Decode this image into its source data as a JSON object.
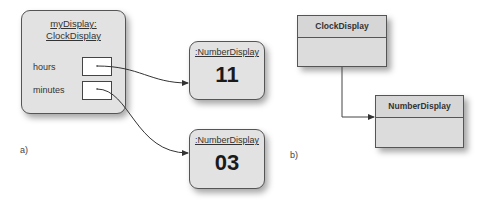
{
  "panel_a": {
    "caption": "a)",
    "clock_object": {
      "title_line1": "myDisplay:",
      "title_line2": "ClockDisplay",
      "fields": [
        {
          "label": "hours"
        },
        {
          "label": "minutes"
        }
      ]
    },
    "number_objects": [
      {
        "title": ":NumberDisplay",
        "value": "11"
      },
      {
        "title": ":NumberDisplay",
        "value": "03"
      }
    ]
  },
  "panel_b": {
    "caption": "b)",
    "classes": [
      {
        "name": "ClockDisplay"
      },
      {
        "name": "NumberDisplay"
      }
    ]
  },
  "colors": {
    "box_fill": "#e2e2e2",
    "class_fill": "#dcdcdc",
    "stroke": "#555555",
    "arrow": "#333333"
  }
}
